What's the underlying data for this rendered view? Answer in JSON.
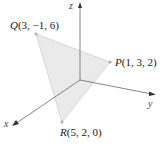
{
  "diagram": {
    "type": "3d-coordinate-triangle",
    "axes": {
      "x": "x",
      "y": "y",
      "z": "z"
    },
    "points": [
      {
        "name": "Q",
        "coords": "(3, −1, 6)"
      },
      {
        "name": "P",
        "coords": "(1, 3, 2)"
      },
      {
        "name": "R",
        "coords": "(5, 2, 0)"
      }
    ],
    "colors": {
      "triangle_fill": "#e6e6e6",
      "triangle_stroke": "#c8c8c8",
      "axis": "#555555",
      "point": "#b0b0b0"
    }
  }
}
